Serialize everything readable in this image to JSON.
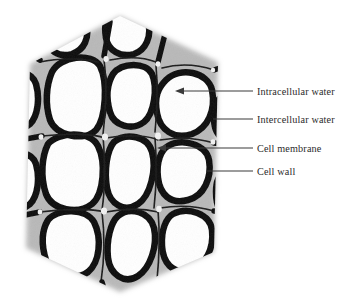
{
  "figure": {
    "type": "micrograph-diagram",
    "specimen_outline": "hexagon",
    "colors": {
      "background": "#ffffff",
      "specimen_background": "#b8b8b8",
      "cell_wall": "#111111",
      "cell_lumen": "#ffffff",
      "leader_line": "#3a3a3a",
      "label_text": "#2b2b2b"
    }
  },
  "annotations": [
    {
      "id": "intracellular-water",
      "label": "Intracellular water",
      "pointer": "arrow",
      "target": "white interior cavity of a cell"
    },
    {
      "id": "intercellular-water",
      "label": "Intercellular water",
      "pointer": "line",
      "target": "small void at junction between three cells"
    },
    {
      "id": "cell-membrane",
      "label": "Cell membrane",
      "pointer": "arrow",
      "target": "inner light boundary lining the cell wall"
    },
    {
      "id": "cell-wall",
      "label": "Cell wall",
      "pointer": "line",
      "target": "thick dark band separating adjacent cells"
    }
  ]
}
